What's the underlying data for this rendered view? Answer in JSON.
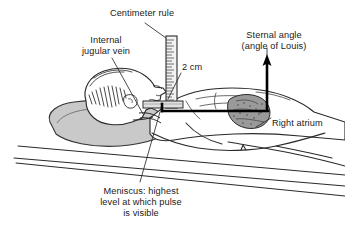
{
  "figure": {
    "background_color": "#ffffff",
    "ink_color": "#1a1a1a",
    "pillow_color": "#c9c9c9",
    "heart_color": "#9a9a9a",
    "accent_color": "#000000"
  },
  "labels": {
    "centimeter_rule": "Centimeter rule",
    "internal_jugular_vein_line1": "Internal",
    "internal_jugular_vein_line2": "jugular vein",
    "sternal_angle_line1": "Sternal angle",
    "sternal_angle_line2": "(angle of Louis)",
    "two_cm": "2 cm",
    "right_atrium": "Right atrium",
    "meniscus_line1": "Meniscus: highest",
    "meniscus_line2": "level at which pulse",
    "meniscus_line3": "is visible"
  },
  "parts": {
    "patient": "supine-patient-figure",
    "pillow": "pillow",
    "head": "head-profile",
    "hair": "hair-hatching",
    "neck": "neck",
    "torso": "torso",
    "arm": "arm",
    "legs": "legs",
    "heart": "right-atrium-heart",
    "ruler": "centimeter-ruler",
    "ruler_ticks": 22,
    "horizontal_reference_line": "sternal-angle-horizontal-line",
    "vertical_arrow": "sternal-angle-up-arrow",
    "bed_lines": "bed-edge-lines",
    "leader_lines": "label-leader-lines"
  }
}
